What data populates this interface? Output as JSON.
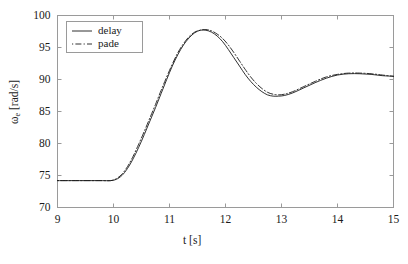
{
  "chart_data": {
    "type": "line",
    "title": "",
    "subtitle": "",
    "xlabel": "t [s]",
    "ylabel": "ωe [rad/s]",
    "ylabel_base": "ω",
    "ylabel_sub": "e",
    "ylabel_unit": " [rad/s]",
    "xlim": [
      9,
      15
    ],
    "ylim": [
      70,
      100
    ],
    "xticks": [
      9,
      10,
      11,
      12,
      13,
      14,
      15
    ],
    "xtick_labels": [
      "9",
      "10",
      "11",
      "12",
      "13",
      "14",
      "15"
    ],
    "yticks": [
      70,
      75,
      80,
      85,
      90,
      95,
      100
    ],
    "ytick_labels": [
      "70",
      "75",
      "80",
      "85",
      "90",
      "95",
      "100"
    ],
    "grid": false,
    "legend_position": "upper left",
    "legend_entries": [
      "delay",
      "pade"
    ],
    "axis_color": "#9a9a9a",
    "line_color": "#1a1a1a",
    "series": [
      {
        "name": "delay",
        "style": "solid",
        "color": "#1a1a1a",
        "x": [
          9.0,
          9.2,
          9.4,
          9.6,
          9.8,
          9.95,
          10.05,
          10.15,
          10.25,
          10.35,
          10.45,
          10.55,
          10.65,
          10.75,
          10.85,
          10.95,
          11.05,
          11.15,
          11.25,
          11.35,
          11.45,
          11.55,
          11.65,
          11.75,
          11.85,
          11.95,
          12.05,
          12.15,
          12.25,
          12.35,
          12.45,
          12.55,
          12.65,
          12.75,
          12.85,
          12.95,
          13.05,
          13.2,
          13.4,
          13.6,
          13.8,
          14.0,
          14.2,
          14.4,
          14.6,
          14.8,
          15.0
        ],
        "y": [
          74.2,
          74.2,
          74.2,
          74.2,
          74.2,
          74.2,
          74.4,
          75.0,
          76.1,
          77.6,
          79.4,
          81.4,
          83.5,
          85.6,
          87.8,
          90.0,
          92.1,
          93.9,
          95.4,
          96.5,
          97.3,
          97.7,
          97.7,
          97.4,
          96.8,
          95.9,
          94.7,
          93.4,
          92.1,
          90.8,
          89.7,
          88.8,
          88.1,
          87.6,
          87.4,
          87.4,
          87.5,
          87.9,
          88.7,
          89.5,
          90.2,
          90.7,
          90.9,
          90.9,
          90.8,
          90.6,
          90.5
        ]
      },
      {
        "name": "pade",
        "style": "dashdot",
        "color": "#1a1a1a",
        "x": [
          9.0,
          9.2,
          9.4,
          9.6,
          9.8,
          9.95,
          10.05,
          10.15,
          10.25,
          10.35,
          10.45,
          10.55,
          10.65,
          10.75,
          10.85,
          10.95,
          11.05,
          11.15,
          11.25,
          11.35,
          11.45,
          11.55,
          11.65,
          11.75,
          11.85,
          11.95,
          12.05,
          12.15,
          12.25,
          12.35,
          12.45,
          12.55,
          12.65,
          12.75,
          12.85,
          12.95,
          13.05,
          13.2,
          13.4,
          13.6,
          13.8,
          14.0,
          14.2,
          14.4,
          14.6,
          14.8,
          15.0
        ],
        "y": [
          74.2,
          74.2,
          74.2,
          74.2,
          74.2,
          74.2,
          74.5,
          75.2,
          76.4,
          78.0,
          79.9,
          81.9,
          84.0,
          86.1,
          88.3,
          90.4,
          92.4,
          94.2,
          95.6,
          96.7,
          97.4,
          97.7,
          97.8,
          97.6,
          97.1,
          96.4,
          95.4,
          94.2,
          92.9,
          91.6,
          90.4,
          89.4,
          88.6,
          88.0,
          87.7,
          87.6,
          87.7,
          88.1,
          88.9,
          89.7,
          90.4,
          90.8,
          91.0,
          91.0,
          90.9,
          90.7,
          90.5
        ]
      }
    ]
  },
  "legend": {
    "entries": [
      {
        "label": "delay",
        "style": "solid"
      },
      {
        "label": "pade",
        "style": "dashdot"
      }
    ]
  }
}
